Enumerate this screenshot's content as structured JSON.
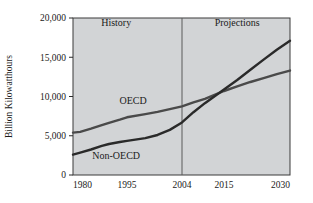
{
  "chart_data": {
    "type": "line",
    "title": "",
    "subtitle": "",
    "xlabel": "",
    "ylabel": "Billion Kilowatthours",
    "xlim": [
      1980,
      2030
    ],
    "ylim": [
      0,
      20000
    ],
    "grid": false,
    "legend_position": "inline-annotation",
    "x_tick_labels": [
      "1980",
      "1995",
      "2004",
      "2015",
      "2030"
    ],
    "x_ticks": [
      1980,
      1995,
      2004,
      2015,
      2030
    ],
    "y_tick_labels": [
      "0",
      "5,000",
      "10,000",
      "15,000",
      "20,000"
    ],
    "y_ticks": [
      0,
      5000,
      10000,
      15000,
      20000
    ],
    "annotations": [
      {
        "text": "History",
        "x": 1992,
        "y": 19000
      },
      {
        "text": "Projections",
        "x": 2018,
        "y": 19000
      }
    ],
    "divider_x": 2004,
    "series": [
      {
        "name": "OECD",
        "label_x": 1996,
        "label_y": 9100,
        "color": "#4a4a4a",
        "x": [
          1980,
          1982,
          1985,
          1988,
          1990,
          1993,
          1995,
          1998,
          2000,
          2002,
          2004,
          2007,
          2010,
          2013,
          2015,
          2018,
          2021,
          2024,
          2027,
          2030
        ],
        "values": [
          5400,
          5500,
          5900,
          6350,
          6650,
          7050,
          7350,
          7750,
          8050,
          8400,
          8750,
          9250,
          9700,
          10300,
          10700,
          11300,
          11850,
          12350,
          12850,
          13300
        ]
      },
      {
        "name": "Non-OECD",
        "label_x": 1992,
        "label_y": 2050,
        "color": "#2a2a2a",
        "x": [
          1980,
          1982,
          1985,
          1988,
          1990,
          1993,
          1995,
          1998,
          2000,
          2002,
          2004,
          2007,
          2010,
          2013,
          2015,
          2018,
          2021,
          2024,
          2027,
          2030
        ],
        "values": [
          2600,
          2850,
          3250,
          3700,
          3950,
          4200,
          4350,
          4700,
          5100,
          5750,
          6700,
          8000,
          9150,
          10200,
          10900,
          12100,
          13400,
          14700,
          15950,
          17100
        ]
      }
    ]
  },
  "style": {
    "plot_background": "#d2d4d6",
    "page_background": "#ffffff",
    "axis_color": "#2a2a2a",
    "oecd_color": "#4a4a4a",
    "nonoecd_color": "#2a2a2a",
    "divider_color": "#5a5a5a"
  }
}
